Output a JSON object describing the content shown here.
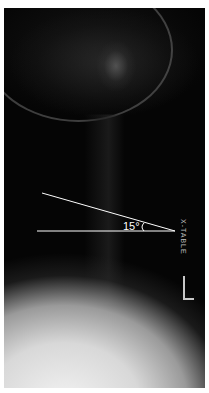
{
  "image": {
    "subject": "lateral cervical spine x-ray",
    "background_color": "#050505"
  },
  "annotation": {
    "angle_label": "15°",
    "line_color": "#ffffff",
    "vertex": [
      175,
      231
    ],
    "line1_start": [
      42,
      193
    ],
    "line2_start": [
      37,
      231
    ]
  },
  "markers": {
    "projection_label": "X-TABLE",
    "side_label": "L"
  }
}
